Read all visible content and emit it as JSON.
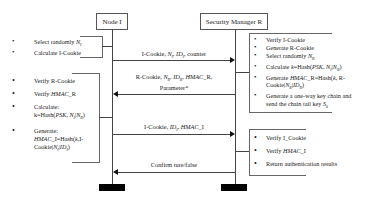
{
  "diagram": {
    "type": "sequence",
    "participants": [
      {
        "id": "node_i",
        "label": "Node I"
      },
      {
        "id": "manager_r",
        "label": "Security Manager R"
      }
    ],
    "node_i_steps_1": [
      {
        "text": "Select randomly N",
        "sub": "I"
      },
      {
        "text": "Calculate I-Cookie"
      }
    ],
    "manager_r_steps_1": [
      {
        "text": "Verify I-Cookie"
      },
      {
        "text": "Generate R-Cookie"
      },
      {
        "text": "Select randomly N",
        "sub": "R"
      },
      {
        "text": "Calculate k=Hash(PSK, N",
        "rest": "I|N",
        "sub": "R",
        "end": ")"
      },
      {
        "line1": "Generate HMAC_R=Hash(k, R-",
        "line2": "Cookie|N",
        "rest": "R|ID",
        "end": "R)"
      },
      {
        "line1": "Generate a one-way key chain and",
        "line2": "send the chain tail key S",
        "sub": "0"
      }
    ],
    "node_i_steps_2": [
      {
        "text": "Verify R-Cookie"
      },
      {
        "text": "Verify HMAC_R"
      },
      {
        "line1": "Calculate:",
        "line2": "k=Hash(PSK, N",
        "rest": "I|N",
        "sub": "R)"
      },
      {
        "line1": "Generate:",
        "line2": "HMAC_I=Hash(k,I-",
        "line3": "Cookie|N",
        "rest": "I|ID",
        "sub": "I)"
      }
    ],
    "manager_r_steps_2": [
      {
        "text": "Verify I_Cookie"
      },
      {
        "text": "Verify HMAC_I"
      },
      {
        "text": "Return authentication results"
      }
    ],
    "messages": [
      {
        "from": "Node I",
        "to": "Security Manager R",
        "label": "I-Cookie, N_I, ID_I, counter"
      },
      {
        "from": "Security Manager R",
        "to": "Node I",
        "label_line1": "R-Cookie, N_R, ID_R, HMAC_R,",
        "label_line2": "Parameter*"
      },
      {
        "from": "Node I",
        "to": "Security Manager R",
        "label": "I-Cookie, ID_I, HMAC_I"
      },
      {
        "from": "Security Manager R",
        "to": "Node I",
        "label": "Confirm ture/false"
      }
    ]
  },
  "labels": {
    "node_i": "Node I",
    "manager_r": "Security Manager R",
    "bullet": "•",
    "m1_a": "I-Cookie, ",
    "m1_n": "N",
    "m1_nsub": "I",
    "m1_sep": ", ",
    "m1_id": "ID",
    "m1_idsub": "I",
    "m1_end": ", counter",
    "m2_a": "R-Cookie, ",
    "m2_n": "N",
    "m2_nsub": "R",
    "m2_sep": ", ",
    "m2_id": "ID",
    "m2_idsub": "R",
    "m2_sep2": ", ",
    "m2_hmac": "HMAC",
    "m2_end": "_R,",
    "m2_line2": "Parameter*",
    "m3_a": "I-Cookie, ",
    "m3_id": "ID",
    "m3_idsub": "I",
    "m3_sep": ", ",
    "m3_hmac": "HMAC",
    "m3_end": "_I",
    "m4": "Confirm ture/false",
    "li1_a": "Select randomly ",
    "li1_n": "N",
    "li1_sub": "I",
    "li2": "Calculate I-Cookie",
    "r1_1": "Verify I-Cookie",
    "r1_2": "Generate R-Cookie",
    "r1_3a": "Select randomly ",
    "r1_3n": "N",
    "r1_3sub": "R",
    "r1_4a": "Calculate ",
    "r1_4k": "k",
    "r1_4b": "=Hash(",
    "r1_4psk": "PSK, N",
    "r1_4s1": "I",
    "r1_4bar": "|",
    "r1_4n2": "N",
    "r1_4s2": "R",
    "r1_4end": ")",
    "r1_5a": "Generate ",
    "r1_5hmac": "HMAC",
    "r1_5b": "_R=Hash(",
    "r1_5k": "k",
    "r1_5c": ", R-",
    "r1_5line2a": "Cookie|",
    "r1_5n": "N",
    "r1_5s1": "R",
    "r1_5bar": "|",
    "r1_5id": "ID",
    "r1_5s2": "R",
    "r1_5end": ")",
    "r1_6line1": "Generate a one-way key chain and",
    "r1_6line2a": "send the chain tail key ",
    "r1_6s": "S",
    "r1_6sub": "0",
    "l2_1": "Verify R-Cookie",
    "l2_2a": "Verify ",
    "l2_2hmac": "HMAC",
    "l2_2b": "_R",
    "l2_3line1": "Calculate:",
    "l2_3a": "k=Hash(",
    "l2_3psk": "PSK, N",
    "l2_3s1": "I",
    "l2_3bar": "|",
    "l2_3n": "N",
    "l2_3s2": "R",
    "l2_3end": ")",
    "l2_4line1": "Generate:",
    "l2_4hmac": "HMAC",
    "l2_4a": "_I=Hash(",
    "l2_4k": "k",
    "l2_4b": ",I-",
    "l2_4line3a": "Cookie|",
    "l2_4n": "N",
    "l2_4s1": "I",
    "l2_4bar": "|",
    "l2_4id": "ID",
    "l2_4s2": "I",
    "l2_4end": ")",
    "r2_1": "Verify I_Cookie",
    "r2_2a": "Verify ",
    "r2_2hmac": "HMAC",
    "r2_2b": "_I",
    "r2_3": "Return authentication results"
  },
  "colors": {
    "line": "#444444",
    "bar": "#000000",
    "text": "#222222",
    "background": "#ffffff"
  }
}
